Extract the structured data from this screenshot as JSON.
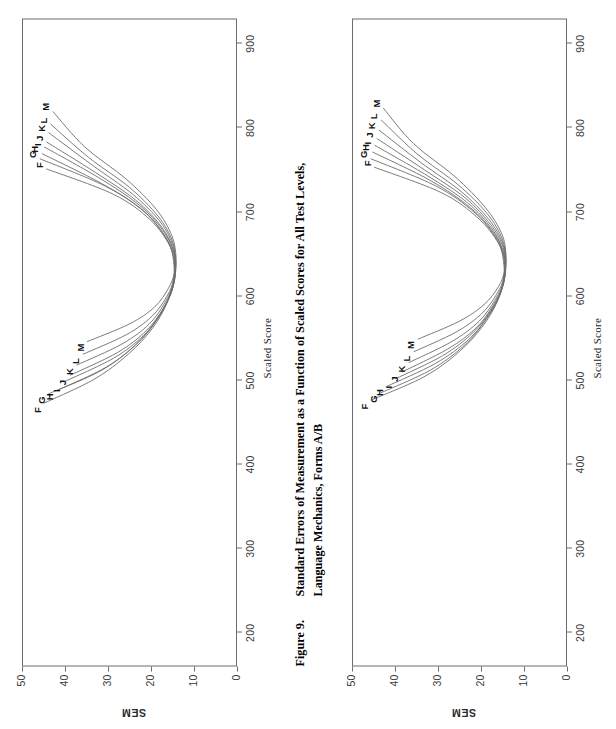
{
  "figure": {
    "number": "Figure 9.",
    "caption_line1": "Standard Errors of Measurement as a Function of Scaled Scores for All Test Levels,",
    "caption_line2": "Language Mechanics, Forms A/B"
  },
  "page": {
    "orientation_note": "landscape figure rotated 90 degrees",
    "background": "#ffffff",
    "line_color": "#6d6d6d"
  },
  "chart_data": [
    {
      "id": "chart-top",
      "type": "line",
      "title": "",
      "xlabel": "Scaled Score",
      "ylabel": "SEM",
      "xlim": [
        160,
        930
      ],
      "ylim": [
        0,
        50
      ],
      "xticks": [
        200,
        300,
        400,
        500,
        600,
        700,
        800,
        900
      ],
      "yticks": [
        0,
        10,
        20,
        30,
        40,
        50
      ],
      "grid": false,
      "legend": "curve end labels",
      "left_labels": [
        "F",
        "G",
        "H",
        "I",
        "J",
        "K",
        "L",
        "M"
      ],
      "right_labels": [
        "F",
        "G",
        "H",
        "I",
        "J",
        "K",
        "L",
        "M"
      ],
      "series": [
        {
          "name": "F",
          "x": [
            472,
            500,
            530,
            560,
            590,
            620,
            640,
            660,
            690,
            720,
            750
          ],
          "y": [
            45.0,
            33.5,
            25.5,
            20.0,
            16.6,
            15.0,
            15.0,
            16.0,
            20.5,
            29.0,
            44.5
          ]
        },
        {
          "name": "G",
          "x": [
            483,
            510,
            540,
            570,
            600,
            625,
            645,
            670,
            700,
            730,
            762
          ],
          "y": [
            44.0,
            32.0,
            24.0,
            19.0,
            15.8,
            14.8,
            15.0,
            17.0,
            22.0,
            31.0,
            46.0
          ]
        },
        {
          "name": "H",
          "x": [
            487,
            515,
            545,
            575,
            603,
            627,
            648,
            673,
            703,
            733,
            768
          ],
          "y": [
            42.0,
            30.5,
            23.0,
            18.3,
            15.5,
            14.7,
            15.0,
            17.3,
            22.6,
            31.8,
            45.5
          ]
        },
        {
          "name": "I",
          "x": [
            497,
            525,
            552,
            580,
            607,
            630,
            652,
            678,
            708,
            740,
            776
          ],
          "y": [
            40.5,
            29.0,
            22.0,
            17.8,
            15.3,
            14.6,
            15.0,
            17.6,
            23.2,
            32.5,
            45.0
          ]
        },
        {
          "name": "J",
          "x": [
            505,
            532,
            558,
            585,
            610,
            632,
            655,
            682,
            713,
            746,
            782
          ],
          "y": [
            39.0,
            28.0,
            21.3,
            17.3,
            15.1,
            14.6,
            15.1,
            17.9,
            23.8,
            33.2,
            44.5
          ]
        },
        {
          "name": "K",
          "x": [
            517,
            542,
            566,
            592,
            615,
            636,
            660,
            688,
            720,
            755,
            793
          ],
          "y": [
            37.5,
            27.0,
            20.6,
            16.9,
            14.9,
            14.5,
            15.2,
            18.2,
            24.5,
            34.0,
            44.0
          ]
        },
        {
          "name": "L",
          "x": [
            530,
            553,
            575,
            599,
            620,
            640,
            665,
            694,
            728,
            764,
            803
          ],
          "y": [
            36.0,
            26.0,
            20.0,
            16.5,
            14.8,
            14.5,
            15.3,
            18.6,
            25.2,
            34.8,
            43.5
          ]
        },
        {
          "name": "M",
          "x": [
            545,
            566,
            586,
            608,
            627,
            645,
            671,
            702,
            738,
            776,
            818
          ],
          "y": [
            35.0,
            25.2,
            19.4,
            16.2,
            14.7,
            14.4,
            15.4,
            19.0,
            26.0,
            35.6,
            43.0
          ]
        }
      ]
    },
    {
      "id": "chart-bottom",
      "type": "line",
      "title": "",
      "xlabel": "Scaled Score",
      "ylabel": "SEM",
      "xlim": [
        160,
        930
      ],
      "ylim": [
        0,
        50
      ],
      "xticks": [
        200,
        300,
        400,
        500,
        600,
        700,
        800,
        900
      ],
      "yticks": [
        0,
        10,
        20,
        30,
        40,
        50
      ],
      "grid": false,
      "legend": "curve end labels",
      "left_labels": [
        "F",
        "G",
        "H",
        "I",
        "J",
        "K",
        "L",
        "M"
      ],
      "right_labels": [
        "F",
        "G",
        "H",
        "I",
        "J",
        "K",
        "L",
        "M"
      ],
      "series": [
        {
          "name": "F",
          "x": [
            476,
            503,
            532,
            562,
            592,
            620,
            640,
            662,
            692,
            722,
            752
          ],
          "y": [
            45.5,
            33.5,
            25.5,
            20.0,
            16.5,
            15.0,
            15.0,
            16.2,
            21.0,
            29.5,
            45.0
          ]
        },
        {
          "name": "G",
          "x": [
            484,
            511,
            540,
            570,
            599,
            625,
            645,
            669,
            699,
            730,
            762
          ],
          "y": [
            43.5,
            32.0,
            24.2,
            19.2,
            15.9,
            14.8,
            15.0,
            16.9,
            21.9,
            30.8,
            45.8
          ]
        },
        {
          "name": "H",
          "x": [
            492,
            519,
            547,
            576,
            604,
            628,
            649,
            674,
            704,
            736,
            770
          ],
          "y": [
            42.0,
            30.8,
            23.2,
            18.5,
            15.6,
            14.7,
            15.0,
            17.3,
            22.7,
            31.9,
            45.4
          ]
        },
        {
          "name": "I",
          "x": [
            501,
            528,
            555,
            582,
            608,
            631,
            653,
            679,
            710,
            742,
            778
          ],
          "y": [
            40.0,
            29.2,
            22.2,
            17.9,
            15.3,
            14.6,
            15.1,
            17.7,
            23.4,
            32.7,
            44.9
          ]
        },
        {
          "name": "J",
          "x": [
            509,
            536,
            561,
            588,
            612,
            634,
            657,
            684,
            716,
            749,
            786
          ],
          "y": [
            38.5,
            28.0,
            21.4,
            17.4,
            15.1,
            14.6,
            15.1,
            18.0,
            24.0,
            33.4,
            44.4
          ]
        },
        {
          "name": "K",
          "x": [
            520,
            545,
            569,
            594,
            617,
            638,
            662,
            690,
            723,
            758,
            796
          ],
          "y": [
            37.0,
            27.0,
            20.7,
            17.0,
            14.9,
            14.5,
            15.2,
            18.4,
            24.8,
            34.3,
            43.9
          ]
        },
        {
          "name": "L",
          "x": [
            533,
            556,
            578,
            601,
            622,
            642,
            667,
            697,
            731,
            768,
            808
          ],
          "y": [
            35.8,
            26.1,
            20.1,
            16.6,
            14.8,
            14.5,
            15.3,
            18.8,
            25.5,
            35.1,
            43.4
          ]
        },
        {
          "name": "M",
          "x": [
            548,
            569,
            589,
            610,
            629,
            647,
            673,
            704,
            741,
            780,
            822
          ],
          "y": [
            34.8,
            25.3,
            19.5,
            16.2,
            14.7,
            14.4,
            15.4,
            19.2,
            26.3,
            35.9,
            42.9
          ]
        }
      ]
    }
  ]
}
